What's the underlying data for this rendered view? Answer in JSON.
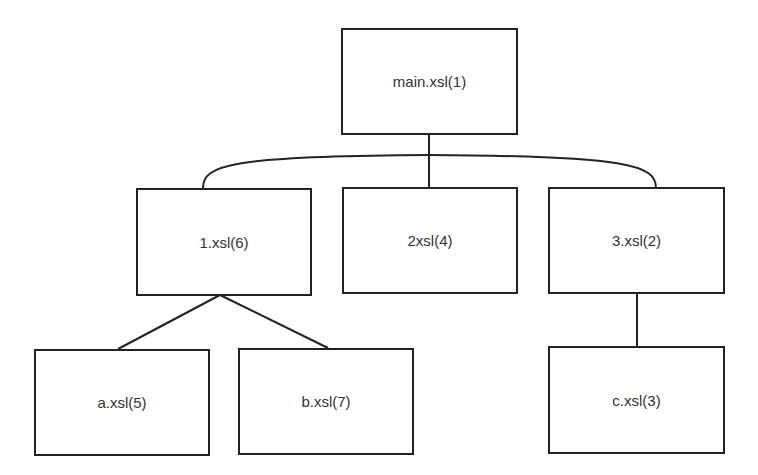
{
  "diagram": {
    "type": "tree",
    "nodes": {
      "main": {
        "label": "main.xsl(1)"
      },
      "n1": {
        "label": "1.xsl(6)"
      },
      "n2": {
        "label": "2xsl(4)"
      },
      "n3": {
        "label": "3.xsl(2)"
      },
      "a": {
        "label": "a.xsl(5)"
      },
      "b": {
        "label": "b.xsl(7)"
      },
      "c": {
        "label": "c.xsl(3)"
      }
    },
    "edges": [
      {
        "from": "main.xsl(1)",
        "to": "1.xsl(6)"
      },
      {
        "from": "main.xsl(1)",
        "to": "2xsl(4)"
      },
      {
        "from": "main.xsl(1)",
        "to": "3.xsl(2)"
      },
      {
        "from": "1.xsl(6)",
        "to": "a.xsl(5)"
      },
      {
        "from": "1.xsl(6)",
        "to": "b.xsl(7)"
      },
      {
        "from": "3.xsl(2)",
        "to": "c.xsl(3)"
      }
    ]
  }
}
